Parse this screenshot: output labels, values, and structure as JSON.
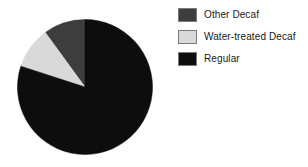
{
  "chart_data": {
    "type": "pie",
    "title": "",
    "subtitle": "",
    "xlabel": "",
    "ylabel": "",
    "grid": false,
    "legend_position": "right",
    "start_angle_deg": 90,
    "direction": "counterclockwise",
    "categories": [
      "Other Decaf",
      "Water-treated Decaf",
      "Regular"
    ],
    "values": [
      10,
      10,
      80
    ],
    "unit": "percent",
    "slices": [
      {
        "label": "Other Decaf",
        "value": 10,
        "percent": 10,
        "angle_deg": 36,
        "color": "#3d3d3d",
        "swatch_name": "legend-swatch-other-decaf"
      },
      {
        "label": "Water-treated Decaf",
        "value": 10,
        "percent": 10,
        "angle_deg": 36,
        "color": "#d9d9d9",
        "swatch_name": "legend-swatch-water-treated-decaf"
      },
      {
        "label": "Regular",
        "value": 80,
        "percent": 80,
        "angle_deg": 288,
        "color": "#0d0d0d",
        "swatch_name": "legend-swatch-regular"
      }
    ]
  },
  "legend": {
    "items": [
      {
        "label": "Other Decaf",
        "color": "#3d3d3d"
      },
      {
        "label": "Water-treated Decaf",
        "color": "#d9d9d9"
      },
      {
        "label": "Regular",
        "color": "#0d0d0d"
      }
    ]
  },
  "colors": {
    "background": "#ffffff",
    "text": "#1a1a1a",
    "swatch_border": "#7a7a7a",
    "other_decaf": "#3d3d3d",
    "water_treated_decaf": "#d9d9d9",
    "regular": "#0d0d0d"
  }
}
